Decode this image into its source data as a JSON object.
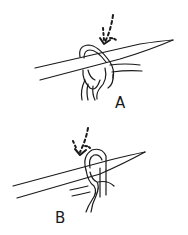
{
  "figure": {
    "background": "#ffffff",
    "ink_color": "#1a1a1a",
    "panels": [
      {
        "id": "A",
        "label": "A",
        "description": "Needle inserted through loop with yarn wrapped; dashed arrow indicates insertion direction"
      },
      {
        "id": "B",
        "label": "B",
        "description": "Needle with single yarn loop wrapped around it; dashed arrow indicates insertion direction"
      }
    ]
  }
}
